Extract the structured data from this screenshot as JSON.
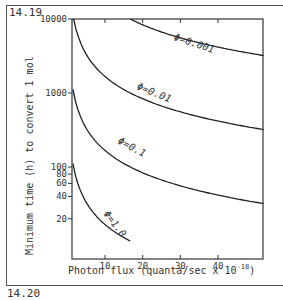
{
  "figure": {
    "number": "14.19",
    "next_number": "14.20"
  },
  "chart_data": {
    "type": "line",
    "title": "",
    "xlabel": "Photon flux (quanta/sec x 10^-18)",
    "xlabel_main": "Photon flux (quanta/sec x 10",
    "xlabel_exp": "-18",
    "xlabel_close": ")",
    "ylabel": "Minimum time (h) to convert 1 mol",
    "yscale": "log",
    "xlim": [
      1,
      53
    ],
    "ylim": [
      10,
      10000
    ],
    "x_ticks": [
      "10",
      "20",
      "30",
      "40"
    ],
    "y_ticks": [
      "10000",
      "1000",
      "100",
      "80",
      "60",
      "40",
      "20"
    ],
    "grid": false,
    "series": [
      {
        "name": "Φ=0.001",
        "label": "Φ=0.001",
        "x": [
          16.7,
          20,
          30,
          40,
          53
        ],
        "y": [
          10000,
          8333,
          5556,
          4167,
          3145
        ]
      },
      {
        "name": "Φ=0.01",
        "label": "Φ=0.01",
        "x": [
          1.67,
          5,
          10,
          20,
          30,
          40,
          53
        ],
        "y": [
          10000,
          3333,
          1667,
          833,
          556,
          417,
          315
        ]
      },
      {
        "name": "Φ=0.1",
        "label": "Φ=0.1",
        "x": [
          1.67,
          5,
          10,
          20,
          30,
          40,
          53
        ],
        "y": [
          1000,
          333,
          167,
          83,
          56,
          42,
          31
        ]
      },
      {
        "name": "Φ=1.0",
        "label": "Φ=1.0",
        "x": [
          1.67,
          5,
          10,
          16.7
        ],
        "y": [
          100,
          33,
          17,
          10
        ]
      }
    ]
  }
}
